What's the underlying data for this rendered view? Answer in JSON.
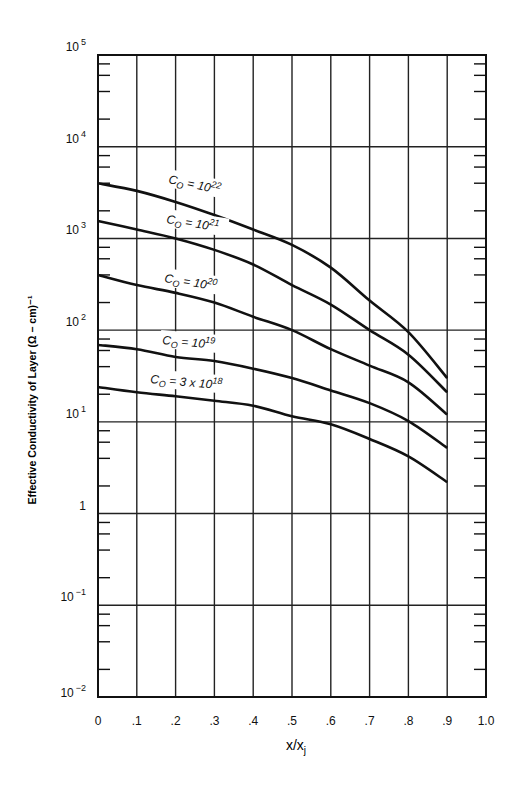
{
  "chart_data": {
    "type": "line",
    "title": "",
    "xlabel": "x/x",
    "xlabel_subscript": "j",
    "ylabel": "Effective Conductivity of Layer (Ω − cm)⁻¹",
    "xlim": [
      0,
      1.0
    ],
    "ylim": [
      0.01,
      100000
    ],
    "yscale": "log",
    "grid": true,
    "legend_position": "inline labels on curves",
    "x_ticks": [
      "0",
      ".1",
      ".2",
      ".3",
      ".4",
      ".5",
      ".6",
      ".7",
      ".8",
      ".9",
      "1.0"
    ],
    "y_ticks": [
      {
        "base": "10",
        "exp": "5",
        "value": 100000
      },
      {
        "base": "10",
        "exp": "4",
        "value": 10000
      },
      {
        "base": "10",
        "exp": "3",
        "value": 1000
      },
      {
        "base": "10",
        "exp": "2",
        "value": 100
      },
      {
        "base": "10",
        "exp": "1",
        "value": 10
      },
      {
        "base": "1",
        "exp": "",
        "value": 1
      },
      {
        "base": "10",
        "exp": "−1",
        "value": 0.1
      },
      {
        "base": "10",
        "exp": "−2",
        "value": 0.01
      }
    ],
    "x": [
      0,
      0.1,
      0.2,
      0.3,
      0.4,
      0.5,
      0.6,
      0.7,
      0.8,
      0.9
    ],
    "series": [
      {
        "name": "C₀ = 10^22",
        "label_main": "C",
        "label_sub": "O",
        "label_eq": " = 10",
        "label_sup": "22",
        "values": [
          4000,
          3300,
          2500,
          1800,
          1250,
          850,
          480,
          210,
          95,
          30
        ],
        "label_pos": [
          168,
          183
        ],
        "label_rot": 12
      },
      {
        "name": "C₀ = 10^21",
        "label_main": "C",
        "label_sub": "O",
        "label_eq": " = 10",
        "label_sup": "21",
        "values": [
          1550,
          1250,
          1000,
          750,
          520,
          310,
          190,
          100,
          54,
          21
        ],
        "label_pos": [
          166,
          223
        ],
        "label_rot": 9
      },
      {
        "name": "C₀ = 10^20",
        "label_main": "C",
        "label_sub": "O",
        "label_eq": " = 10",
        "label_sup": "20",
        "values": [
          400,
          310,
          255,
          200,
          140,
          100,
          62,
          41,
          27,
          12
        ],
        "label_pos": [
          164,
          282
        ],
        "label_rot": 9
      },
      {
        "name": "C₀ = 10^19",
        "label_main": "C",
        "label_sub": "O",
        "label_eq": " = 10",
        "label_sup": "19",
        "values": [
          69,
          62,
          51,
          46,
          38,
          30,
          22,
          16,
          10.2,
          5.2
        ],
        "label_pos": [
          162,
          344
        ],
        "label_rot": 5
      },
      {
        "name": "C₀ = 3 x 10^18",
        "label_main": "C",
        "label_sub": "O",
        "label_eq": " = 3 x 10",
        "label_sup": "18",
        "values": [
          24,
          21,
          19,
          17,
          15,
          11.5,
          9.4,
          6.5,
          4.2,
          2.2
        ],
        "label_pos": [
          150,
          383
        ],
        "label_rot": 5
      }
    ]
  },
  "layout": {
    "plot_left": 98,
    "plot_right": 486,
    "plot_top": 55,
    "plot_bottom": 697,
    "line_color": "#111111",
    "grid_color": "#222222"
  }
}
